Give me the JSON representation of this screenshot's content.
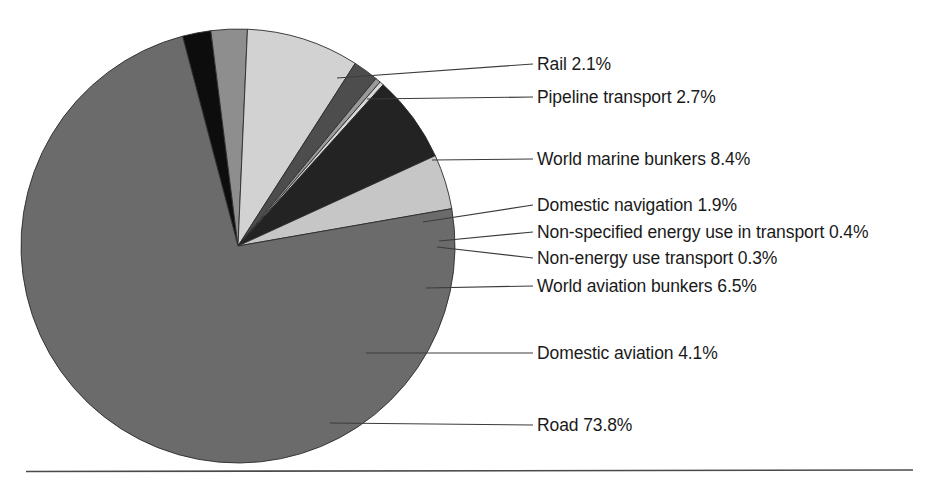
{
  "figure": {
    "background_color": "#ffffff",
    "text_color": "#1a1a1a",
    "rule_color": "#4a4a4a",
    "leader_color": "#3c3c3c",
    "slice_edge_color": "#2b2b2b"
  },
  "chart_data": {
    "type": "pie",
    "title": "",
    "subtitle": "",
    "xlabel": "",
    "ylabel": "",
    "legend_position": "callout-labels-right",
    "grid": false,
    "total_percent": 100.2,
    "value_unit": "%",
    "categories": [
      "Road",
      "Rail",
      "Pipeline transport",
      "World marine bunkers",
      "Domestic navigation",
      "Non-specified energy use in transport",
      "Non-energy use transport",
      "World aviation bunkers",
      "Domestic aviation"
    ],
    "values": [
      73.8,
      2.1,
      2.7,
      8.4,
      1.9,
      0.4,
      0.3,
      6.5,
      4.1
    ],
    "colors": [
      "#6b6b6b",
      "#0d0d0d",
      "#8e8e8e",
      "#d2d2d2",
      "#4d4d4d",
      "#9a9a9a",
      "#d8d8d8",
      "#232323",
      "#c6c6c6"
    ],
    "slices": [
      {
        "label": "Rail",
        "value": 2.1,
        "display": "Rail 2.1%",
        "color": "#0d0d0d",
        "start_angle": 255.2,
        "end_angle": 262.8
      },
      {
        "label": "Pipeline transport",
        "value": 2.7,
        "display": "Pipeline transport 2.7%",
        "color": "#8e8e8e",
        "start_angle": 262.8,
        "end_angle": 272.5
      },
      {
        "label": "World marine bunkers",
        "value": 8.4,
        "display": "World marine bunkers 8.4%",
        "color": "#d2d2d2",
        "start_angle": 272.5,
        "end_angle": 302.7
      },
      {
        "label": "Domestic navigation",
        "value": 1.9,
        "display": "Domestic navigation 1.9%",
        "color": "#4d4d4d",
        "start_angle": 302.7,
        "end_angle": 309.5
      },
      {
        "label": "Non-specified energy use in transport",
        "value": 0.4,
        "display": "Non-specified energy use in transport 0.4%",
        "color": "#9a9a9a",
        "start_angle": 309.5,
        "end_angle": 310.9
      },
      {
        "label": "Non-energy use transport",
        "value": 0.3,
        "display": "Non-energy use transport 0.3%",
        "color": "#d8d8d8",
        "start_angle": 310.9,
        "end_angle": 312.0
      },
      {
        "label": "World aviation bunkers",
        "value": 6.5,
        "display": "World aviation bunkers 6.5%",
        "color": "#232323",
        "start_angle": 312.0,
        "end_angle": 335.4
      },
      {
        "label": "Domestic aviation",
        "value": 4.1,
        "display": "Domestic aviation 4.1%",
        "color": "#c6c6c6",
        "start_angle": 335.4,
        "end_angle": 350.1
      },
      {
        "label": "Road",
        "value": 73.8,
        "display": "Road 73.8%",
        "color": "#6b6b6b",
        "start_angle": 350.1,
        "end_angle": 615.2
      }
    ]
  },
  "labels": {
    "rail": "Rail 2.1%",
    "pipeline": "Pipeline transport 2.7%",
    "marine": "World marine bunkers 8.4%",
    "navigation": "Domestic navigation 1.9%",
    "nonspecified": "Non-specified energy use in transport 0.4%",
    "nonenergy": "Non-energy use transport 0.3%",
    "aviation_bunkers": "World aviation bunkers 6.5%",
    "domestic_aviation": "Domestic aviation 4.1%",
    "road": "Road 73.8%"
  }
}
